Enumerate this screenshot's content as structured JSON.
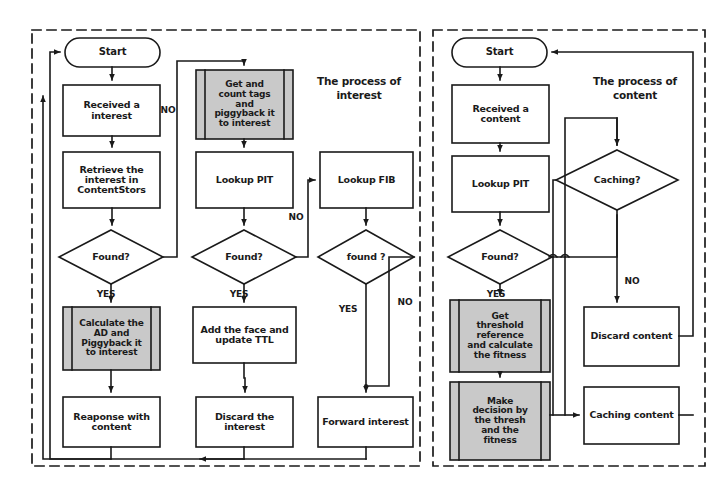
{
  "figure": {
    "type": "flowchart",
    "panels": [
      {
        "id": "interest",
        "title": "The process of\ninterest",
        "nodes": [
          {
            "id": "start-i",
            "kind": "terminator",
            "label": "Start"
          },
          {
            "id": "received-i",
            "kind": "process",
            "label": "Received a\ninterest"
          },
          {
            "id": "retrieve-cs",
            "kind": "process",
            "label": "Retrieve the\ninterest in\nContentStors"
          },
          {
            "id": "found-cs",
            "kind": "decision",
            "label": "Found?"
          },
          {
            "id": "calc-ad",
            "kind": "predefined-process",
            "label": "Calculate the\nAD and\nPiggyback it\nto interest"
          },
          {
            "id": "response",
            "kind": "process",
            "label": "Reaponse with\ncontent"
          },
          {
            "id": "get-count-tags",
            "kind": "predefined-process",
            "label": "Get and\ncount tags\nand\npiggyback it\nto interest"
          },
          {
            "id": "lookup-pit-i",
            "kind": "process",
            "label": "Lookup PIT"
          },
          {
            "id": "found-pit",
            "kind": "decision",
            "label": "Found?"
          },
          {
            "id": "add-face",
            "kind": "process",
            "label": "Add the face and\nupdate TTL"
          },
          {
            "id": "discard-i",
            "kind": "process",
            "label": "Discard the\ninterest"
          },
          {
            "id": "lookup-fib",
            "kind": "process",
            "label": "Lookup FIB"
          },
          {
            "id": "found-fib",
            "kind": "decision",
            "label": "found ?"
          },
          {
            "id": "forward-i",
            "kind": "process",
            "label": "Forward interest"
          }
        ],
        "edge_labels": [
          {
            "id": "no-cs",
            "text": "NO"
          },
          {
            "id": "yes-cs",
            "text": "YES"
          },
          {
            "id": "no-pit",
            "text": "NO"
          },
          {
            "id": "yes-pit",
            "text": "YES"
          },
          {
            "id": "yes-fib",
            "text": "YES"
          },
          {
            "id": "no-fib",
            "text": "NO"
          }
        ]
      },
      {
        "id": "content",
        "title": "The  process of\ncontent",
        "nodes": [
          {
            "id": "start-c",
            "kind": "terminator",
            "label": "Start"
          },
          {
            "id": "received-c",
            "kind": "process",
            "label": "Received a\ncontent"
          },
          {
            "id": "lookup-pit-c",
            "kind": "process",
            "label": "Lookup PIT"
          },
          {
            "id": "found-pit-c",
            "kind": "decision",
            "label": "Found?"
          },
          {
            "id": "get-threshold",
            "kind": "predefined-process",
            "label": "Get\nthreshold\nreference\nand calculate\nthe fitness"
          },
          {
            "id": "make-decision",
            "kind": "predefined-process",
            "label": "Make\ndecision by\nthe thresh\nand the\nfitness"
          },
          {
            "id": "caching-q",
            "kind": "decision",
            "label": "Caching?"
          },
          {
            "id": "discard-c",
            "kind": "process",
            "label": "Discard content"
          },
          {
            "id": "caching-c",
            "kind": "process",
            "label": "Caching content"
          }
        ],
        "edge_labels": [
          {
            "id": "yes-pit-c",
            "text": "YES"
          },
          {
            "id": "no-caching",
            "text": "NO"
          }
        ]
      }
    ],
    "colors": {
      "stroke": "#1a1a1a",
      "fill": "#ffffff",
      "shaded_fill": "#c9c9c9",
      "panel_border": "#1a1a1a",
      "background": "#ffffff"
    }
  }
}
